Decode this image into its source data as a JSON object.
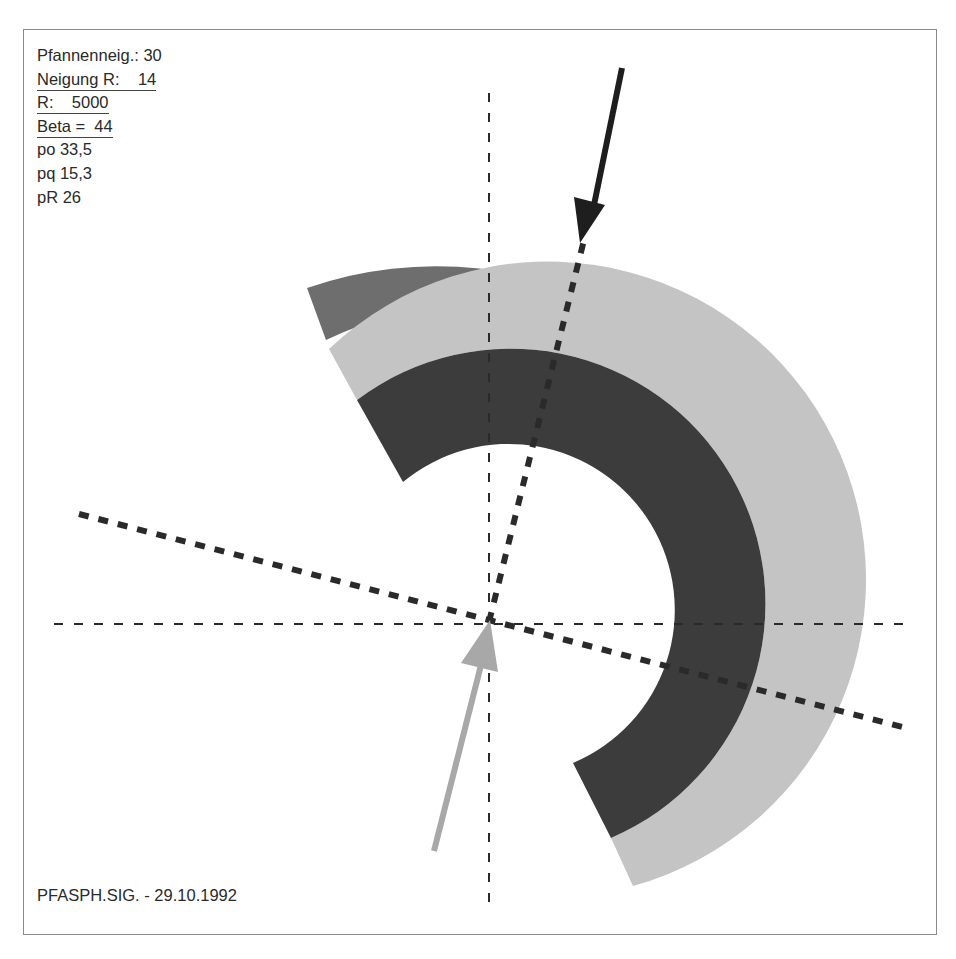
{
  "params": {
    "pfannenneig": "Pfannenneig.: 30",
    "neigung_r": "Neigung R:    14",
    "r": "R:    5000",
    "beta": "Beta =  44",
    "po": "po 33,5",
    "pq": "pq 15,3",
    "pr": "pR 26"
  },
  "caption": "PFASPH.SIG. - 29.10.1992",
  "colors": {
    "outer_ring": "#6e6e6e",
    "middle_ring": "#c4c4c4",
    "inner_ring": "#3c3c3c",
    "black_arrow": "#1e1e1e",
    "gray_arrow": "#a8a8a8",
    "dashes": "#2a2a2a",
    "frame": "#8a8a8a"
  }
}
